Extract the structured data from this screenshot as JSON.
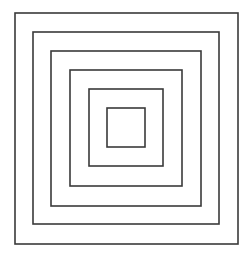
{
  "canvas": {
    "width": 252,
    "height": 254,
    "background": "#ffffff"
  },
  "style": {
    "stroke": "#3a3a3a",
    "stroke_width": 1.6
  },
  "squares": [
    {
      "x1": 15,
      "y1": 13,
      "x2": 238,
      "y2": 244
    },
    {
      "x1": 33,
      "y1": 32,
      "x2": 219,
      "y2": 224
    },
    {
      "x1": 51,
      "y1": 51,
      "x2": 201,
      "y2": 206
    },
    {
      "x1": 70,
      "y1": 70,
      "x2": 182,
      "y2": 186
    },
    {
      "x1": 89,
      "y1": 89,
      "x2": 163,
      "y2": 166
    },
    {
      "x1": 107,
      "y1": 108,
      "x2": 145,
      "y2": 147
    }
  ]
}
